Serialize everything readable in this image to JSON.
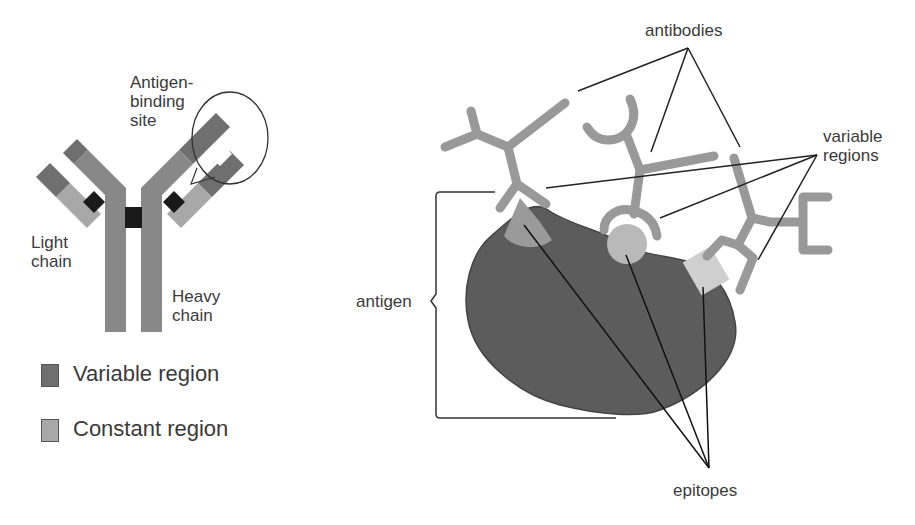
{
  "left_panel": {
    "labels": {
      "antigen_binding_site": "Antigen-\nbinding\nsite",
      "light_chain": "Light\nchain",
      "heavy_chain": "Heavy\nchain"
    },
    "legend": [
      {
        "label": "Variable region",
        "color": "#6f6f6f"
      },
      {
        "label": "Constant region",
        "color": "#a8a8a8"
      }
    ]
  },
  "right_panel": {
    "labels": {
      "antibodies": "antibodies",
      "variable_regions": "variable\nregions",
      "antigen": "antigen",
      "epitopes": "epitopes"
    }
  },
  "colors": {
    "variable": "#6f6f6f",
    "constant": "#a8a8a8",
    "heavy_chain": "#888888",
    "disulfide": "#1a1a1a",
    "antigen_body": "#5a5a5a",
    "antibody_stroke": "#9a9a9a",
    "epitope": "#bdbdbd",
    "text": "#3a3a3a",
    "line": "#222222"
  }
}
